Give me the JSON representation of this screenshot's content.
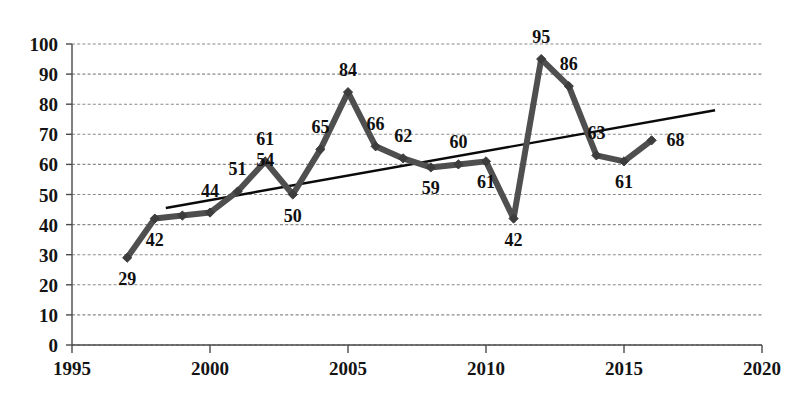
{
  "chart_data": {
    "type": "line",
    "title": "",
    "subtitle": "",
    "xlabel": "",
    "ylabel": "",
    "xlim": [
      1995,
      2020
    ],
    "ylim": [
      0,
      100
    ],
    "grid": true,
    "legend": null,
    "x_tick_labels": [
      "1995",
      "2000",
      "2005",
      "2010",
      "2015",
      "2020"
    ],
    "x_ticks": [
      1995,
      2000,
      2005,
      2010,
      2015,
      2020
    ],
    "y_tick_labels": [
      "0",
      "10",
      "20",
      "30",
      "40",
      "50",
      "60",
      "70",
      "80",
      "90",
      "100"
    ],
    "y_ticks": [
      0,
      10,
      20,
      30,
      40,
      50,
      60,
      70,
      80,
      90,
      100
    ],
    "x": [
      1997,
      1998,
      1999,
      2000,
      2001,
      2002,
      2003,
      2004,
      2005,
      2006,
      2007,
      2008,
      2009,
      2010,
      2011,
      2012,
      2013,
      2014,
      2015,
      2016
    ],
    "values": [
      29,
      42,
      43,
      44,
      51,
      61,
      50,
      65,
      84,
      66,
      62,
      59,
      60,
      61,
      42,
      95,
      86,
      63,
      61,
      68
    ],
    "point_labels": [
      {
        "x": 1997,
        "y": 29,
        "text": "29",
        "pos": "below"
      },
      {
        "x": 1998,
        "y": 42,
        "text": "42",
        "pos": "below"
      },
      {
        "x": 2000,
        "y": 44,
        "text": "44",
        "pos": "above"
      },
      {
        "x": 2001,
        "y": 51,
        "text": "51",
        "pos": "above"
      },
      {
        "x": 2002,
        "y": 54,
        "text": "54",
        "pos": "above"
      },
      {
        "x": 2002,
        "y": 61,
        "text": "61",
        "pos": "above"
      },
      {
        "x": 2003,
        "y": 50,
        "text": "50",
        "pos": "below"
      },
      {
        "x": 2004,
        "y": 65,
        "text": "65",
        "pos": "above"
      },
      {
        "x": 2005,
        "y": 84,
        "text": "84",
        "pos": "above"
      },
      {
        "x": 2006,
        "y": 66,
        "text": "66",
        "pos": "above"
      },
      {
        "x": 2007,
        "y": 62,
        "text": "62",
        "pos": "above"
      },
      {
        "x": 2008,
        "y": 59,
        "text": "59",
        "pos": "below"
      },
      {
        "x": 2009,
        "y": 60,
        "text": "60",
        "pos": "above"
      },
      {
        "x": 2010,
        "y": 61,
        "text": "61",
        "pos": "below"
      },
      {
        "x": 2011,
        "y": 42,
        "text": "42",
        "pos": "below"
      },
      {
        "x": 2012,
        "y": 95,
        "text": "95",
        "pos": "above"
      },
      {
        "x": 2013,
        "y": 86,
        "text": "86",
        "pos": "above"
      },
      {
        "x": 2014,
        "y": 63,
        "text": "63",
        "pos": "above"
      },
      {
        "x": 2015,
        "y": 61,
        "text": "61",
        "pos": "below"
      },
      {
        "x": 2016,
        "y": 68,
        "text": "68",
        "pos": "right"
      }
    ],
    "trendline": {
      "type": "linear",
      "x_start": 1998.4,
      "y_start": 45.5,
      "x_end": 2018.3,
      "y_end": 78.0
    },
    "colors": {
      "series": "#4f4f4f",
      "marker": "#3d3d3d",
      "trendline": "#0a0a0a",
      "grid": "#8a8a8a",
      "axis": "#4a4a4a",
      "text": "#141414",
      "background": "#ffffff"
    }
  }
}
